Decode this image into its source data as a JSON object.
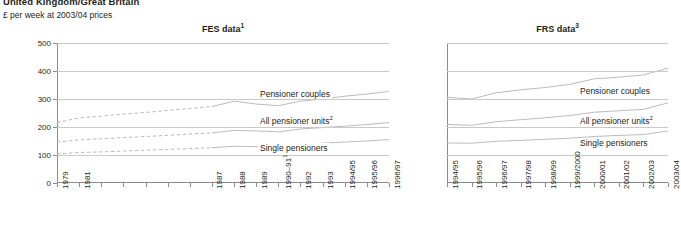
{
  "header": {
    "title": "United Kingdom/Great Britain",
    "units": "£ per week at 2003/04 prices"
  },
  "colors": {
    "line": "#b3b3b3",
    "grid": "#c9c9c9",
    "axis": "#8c8c8c",
    "text": "#231f20"
  },
  "panels": {
    "left": {
      "title": "FES data",
      "title_note": "1"
    },
    "right": {
      "title": "FRS data",
      "title_note": "3"
    }
  },
  "axis": {
    "y_ticks": [
      "0",
      "100",
      "200",
      "300",
      "400",
      "500"
    ],
    "y_min": 0,
    "y_max": 500
  },
  "series_labels": {
    "couples": "Pensioner couples",
    "all_units": "All pensioner units",
    "all_units_note": "2",
    "single": "Single pensioners"
  },
  "chart_data": [
    {
      "type": "line",
      "title": "FES data¹",
      "xlabel": "",
      "ylabel": "£ per week at 2003/04 prices",
      "ylim": [
        0,
        500
      ],
      "yticks": [
        0,
        100,
        200,
        300,
        400,
        500
      ],
      "grid": true,
      "legend": "inline-labels",
      "categories": [
        "1979",
        "1981",
        "1982",
        "1983",
        "1984",
        "1985",
        "1986",
        "1987",
        "1988",
        "1989",
        "1990–91",
        "1992",
        "1993",
        "1994/95",
        "1995/96",
        "1996/97"
      ],
      "category_notes": {
        "1990–91": "1"
      },
      "ticks_labelled": [
        "1979",
        "1981",
        "1987",
        "1988",
        "1989",
        "1990–91",
        "1992",
        "1993",
        "1994/95",
        "1995/96",
        "1996/97"
      ],
      "dashed_segment_through": "1987",
      "series": [
        {
          "name": "Pensioner couples",
          "values": [
            216,
            232,
            239,
            246,
            252,
            259,
            266,
            273,
            292,
            282,
            276,
            292,
            300,
            310,
            318,
            327
          ]
        },
        {
          "name": "All pensioner units",
          "values": [
            146,
            154,
            158,
            162,
            166,
            170,
            175,
            179,
            188,
            186,
            183,
            193,
            198,
            203,
            209,
            216
          ]
        },
        {
          "name": "Single pensioners",
          "values": [
            104,
            109,
            111,
            114,
            117,
            120,
            123,
            126,
            131,
            130,
            129,
            137,
            142,
            146,
            150,
            155
          ]
        }
      ]
    },
    {
      "type": "line",
      "title": "FRS data³",
      "xlabel": "",
      "ylabel": "",
      "ylim": [
        0,
        500
      ],
      "yticks": [
        0,
        100,
        200,
        300,
        400,
        500
      ],
      "grid": true,
      "legend": "inline-labels",
      "categories": [
        "1994/95",
        "1995/96",
        "1996/97",
        "1997/98",
        "1998/99",
        "1999/2000",
        "2000/01",
        "2001/02",
        "2002/03",
        "2003/04"
      ],
      "series": [
        {
          "name": "Pensioner couples",
          "values": [
            306,
            300,
            322,
            333,
            341,
            352,
            372,
            378,
            386,
            410
          ]
        },
        {
          "name": "All pensioner units",
          "values": [
            209,
            206,
            219,
            226,
            233,
            241,
            253,
            258,
            263,
            286
          ]
        },
        {
          "name": "Single pensioners",
          "values": [
            143,
            142,
            149,
            152,
            156,
            160,
            166,
            170,
            173,
            186
          ]
        }
      ]
    }
  ]
}
